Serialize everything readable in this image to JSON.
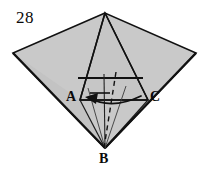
{
  "figure": {
    "number": "28",
    "type": "geometry-fold-diagram",
    "background_color": "#ffffff",
    "fill_color": "#c9c9c9",
    "fill_color_dark": "#bdbdbd",
    "stroke_color": "#111111",
    "labels": {
      "number": "28",
      "vertex_a": "A",
      "vertex_b": "B",
      "vertex_c": "C"
    },
    "vertices": {
      "apex_top": {
        "x": 105,
        "y": 13
      },
      "left": {
        "x": 13,
        "y": 53
      },
      "right": {
        "x": 196,
        "y": 53
      },
      "bottom_b": {
        "x": 105,
        "y": 148
      },
      "point_a": {
        "x": 80,
        "y": 100
      },
      "point_c": {
        "x": 148,
        "y": 100
      }
    },
    "annotations": {
      "rotation_arrow": "curved-arrow-left",
      "fold_line_style_solid": "solid",
      "fold_line_style_hidden": "dashed"
    }
  }
}
